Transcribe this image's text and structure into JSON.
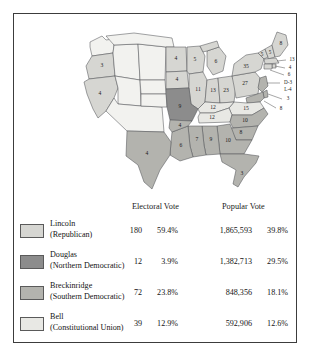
{
  "columns": {
    "electoral": "Electoral Vote",
    "popular": "Popular Vote"
  },
  "colors": {
    "lincoln": "#d6d6d2",
    "douglas": "#8c8c8c",
    "breckinridge": "#b3b3ae",
    "bell": "#e8e8e4",
    "territory": "#f2f2ef",
    "border": "#55565a",
    "frame": "#3c3c3c"
  },
  "legend": {
    "rows": [
      {
        "candidate": "Lincoln",
        "party": "(Republican)",
        "swatch": "lincoln",
        "electoral_votes": "180",
        "electoral_pct": "59.4%",
        "popular_votes": "1,865,593",
        "popular_pct": "39.8%"
      },
      {
        "candidate": "Douglas",
        "party": "(Northern Democratic)",
        "swatch": "douglas",
        "electoral_votes": "12",
        "electoral_pct": "3.9%",
        "popular_votes": "1,382,713",
        "popular_pct": "29.5%"
      },
      {
        "candidate": "Breckinridge",
        "party": "(Southern Democratic)",
        "swatch": "breckinridge",
        "electoral_votes": "72",
        "electoral_pct": "23.8%",
        "popular_votes": "848,356",
        "popular_pct": "18.1%"
      },
      {
        "candidate": "Bell",
        "party": "(Constitutional Union)",
        "swatch": "bell",
        "electoral_votes": "39",
        "electoral_pct": "12.9%",
        "popular_votes": "592,906",
        "popular_pct": "12.6%"
      }
    ]
  },
  "map": {
    "state_labels": [
      {
        "state": "oregon",
        "value": "3",
        "winner": "lincoln"
      },
      {
        "state": "california",
        "value": "4",
        "winner": "lincoln"
      },
      {
        "state": "minnesota",
        "value": "4",
        "winner": "lincoln"
      },
      {
        "state": "iowa",
        "value": "4",
        "winner": "lincoln"
      },
      {
        "state": "wisconsin",
        "value": "5",
        "winner": "lincoln"
      },
      {
        "state": "michigan",
        "value": "6",
        "winner": "lincoln"
      },
      {
        "state": "missouri",
        "value": "9",
        "winner": "douglas"
      },
      {
        "state": "illinois",
        "value": "11",
        "winner": "lincoln"
      },
      {
        "state": "indiana",
        "value": "13",
        "winner": "lincoln"
      },
      {
        "state": "ohio",
        "value": "23",
        "winner": "lincoln"
      },
      {
        "state": "pennsylvania",
        "value": "27",
        "winner": "lincoln"
      },
      {
        "state": "new-york",
        "value": "35",
        "winner": "lincoln"
      },
      {
        "state": "maine",
        "value": "8",
        "winner": "lincoln"
      },
      {
        "state": "new-hampshire",
        "value": "5",
        "winner": "lincoln"
      },
      {
        "state": "vermont",
        "value": "5",
        "winner": "lincoln"
      },
      {
        "state": "massachusetts",
        "value": "13",
        "winner": "lincoln"
      },
      {
        "state": "rhode-island",
        "value": "4",
        "winner": "lincoln"
      },
      {
        "state": "connecticut",
        "value": "6",
        "winner": "lincoln"
      },
      {
        "state": "new-jersey",
        "value": "D-3",
        "winner": "split"
      },
      {
        "state": "new-jersey-l",
        "value": "L-4",
        "winner": "split"
      },
      {
        "state": "delaware",
        "value": "3",
        "winner": "breckinridge"
      },
      {
        "state": "maryland",
        "value": "8",
        "winner": "breckinridge"
      },
      {
        "state": "virginia",
        "value": "15",
        "winner": "bell"
      },
      {
        "state": "kentucky",
        "value": "12",
        "winner": "bell"
      },
      {
        "state": "tennessee",
        "value": "12",
        "winner": "bell"
      },
      {
        "state": "north-carolina",
        "value": "10",
        "winner": "breckinridge"
      },
      {
        "state": "south-carolina",
        "value": "8",
        "winner": "breckinridge"
      },
      {
        "state": "georgia",
        "value": "10",
        "winner": "breckinridge"
      },
      {
        "state": "florida",
        "value": "3",
        "winner": "breckinridge"
      },
      {
        "state": "alabama",
        "value": "9",
        "winner": "breckinridge"
      },
      {
        "state": "mississippi",
        "value": "7",
        "winner": "breckinridge"
      },
      {
        "state": "louisiana",
        "value": "6",
        "winner": "breckinridge"
      },
      {
        "state": "arkansas",
        "value": "4",
        "winner": "breckinridge"
      },
      {
        "state": "texas",
        "value": "4",
        "winner": "breckinridge"
      }
    ]
  }
}
